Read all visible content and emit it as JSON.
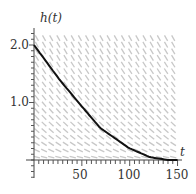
{
  "chart_data": {
    "type": "line",
    "title": "",
    "xlabel": "t",
    "ylabel": "h(t)",
    "xlim": [
      0,
      150
    ],
    "ylim": [
      0,
      2.2
    ],
    "x_ticks": [
      50,
      100,
      150
    ],
    "x_tick_labels": [
      "50",
      "100",
      "150"
    ],
    "y_ticks": [
      1.0,
      2.0
    ],
    "y_tick_labels": [
      "1.0",
      "2.0"
    ],
    "grid": false,
    "legend": null,
    "background": "slope field (direction field) of dh/dt = -k·sqrt(h), light gray segments",
    "series": [
      {
        "name": "h(t)",
        "color": "#111111",
        "x": [
          0,
          27,
          48,
          69,
          99,
          121,
          140
        ],
        "y": [
          2.0,
          1.39,
          0.97,
          0.56,
          0.21,
          0.05,
          0.0
        ]
      }
    ]
  },
  "labels": {
    "y_axis": "h(t)",
    "x_axis": "t",
    "y_tick_2": "2.0",
    "y_tick_1": "1.0",
    "x_tick_50": "50",
    "x_tick_100": "100",
    "x_tick_150": "150"
  },
  "colors": {
    "curve": "#111111",
    "axis": "#444444",
    "slope_field": "#c8c8c8"
  }
}
